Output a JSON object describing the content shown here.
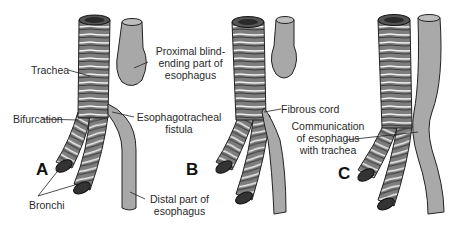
{
  "figure": {
    "panels": [
      {
        "id": "A",
        "letter": "A",
        "labels": {
          "trachea": "Trachea",
          "proximal_line1": "Proximal blind-",
          "proximal_line2": "ending part of",
          "proximal_line3": "esophagus",
          "bifurcation": "Bifurcation",
          "fistula_line1": "Esophagotracheal",
          "fistula_line2": "fistula",
          "bronchi": "Bronchi",
          "distal_line1": "Distal part of",
          "distal_line2": "esophagus"
        }
      },
      {
        "id": "B",
        "letter": "B",
        "labels": {
          "fibrous_cord": "Fibrous cord"
        }
      },
      {
        "id": "C",
        "letter": "C",
        "labels": {
          "comm_line1": "Communication",
          "comm_line2": "of esophagus",
          "comm_line3": "with trachea"
        }
      }
    ],
    "colors": {
      "tissue": "#8a8a8a",
      "tissue_dark": "#4a4a4a",
      "esophagus": "#a9a9a9",
      "outline": "#222222",
      "ring_highlight": "#f2f2f2",
      "background": "#ffffff"
    }
  }
}
